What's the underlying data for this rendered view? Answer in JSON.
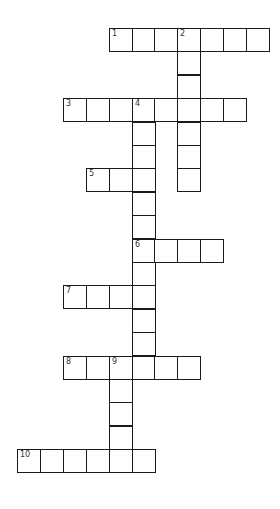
{
  "puzzle": {
    "grid_origin": {
      "x": 17,
      "y": 28
    },
    "cell_size": 23.4,
    "colors": {
      "line": "#1a1a1a",
      "cell_bg": "#ffffff",
      "number": "#333333"
    },
    "entries": [
      {
        "number": "1",
        "direction": "across",
        "row": 0,
        "col": 4,
        "length": 7
      },
      {
        "number": "2",
        "direction": "down",
        "row": 0,
        "col": 7,
        "length": 7
      },
      {
        "number": "3",
        "direction": "across",
        "row": 3,
        "col": 2,
        "length": 8
      },
      {
        "number": "4",
        "direction": "down",
        "row": 3,
        "col": 5,
        "length": 12
      },
      {
        "number": "5",
        "direction": "across",
        "row": 6,
        "col": 3,
        "length": 3
      },
      {
        "number": "6",
        "direction": "across",
        "row": 9,
        "col": 5,
        "length": 4
      },
      {
        "number": "7",
        "direction": "across",
        "row": 11,
        "col": 2,
        "length": 4
      },
      {
        "number": "8",
        "direction": "across",
        "row": 14,
        "col": 2,
        "length": 6
      },
      {
        "number": "9",
        "direction": "down",
        "row": 14,
        "col": 4,
        "length": 5
      },
      {
        "number": "10",
        "direction": "across",
        "row": 18,
        "col": 0,
        "length": 6
      }
    ]
  }
}
